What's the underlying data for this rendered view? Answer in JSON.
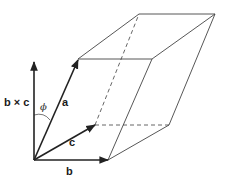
{
  "diagram": {
    "labels": {
      "a": "a",
      "b": "b",
      "c": "c",
      "bxc": "b × c",
      "phi": "ϕ"
    },
    "colors": {
      "line": "#333333",
      "arrow": "#222222",
      "background": "#ffffff"
    },
    "vertices": {
      "O": [
        34,
        160
      ],
      "a": [
        78,
        59
      ],
      "b": [
        108,
        160
      ],
      "c": [
        95,
        125
      ],
      "a_plus_b": [
        152,
        59
      ],
      "b_plus_c": [
        169,
        125
      ],
      "a_plus_c": [
        139,
        14
      ],
      "a_plus_b_plus_c": [
        215,
        14
      ],
      "bxc_tip": [
        34,
        62
      ]
    }
  }
}
